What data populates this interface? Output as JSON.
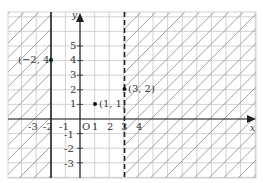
{
  "diagram": {
    "type": "coordinate-plane-inequality-graph",
    "axes": {
      "x_label": "x",
      "y_label": "y",
      "origin_label": "O",
      "x_ticks": [
        "-3",
        "-2",
        "-1",
        "1",
        "2",
        "3",
        "4"
      ],
      "y_ticks": [
        "5",
        "4",
        "3",
        "2",
        "1",
        "-1",
        "-2",
        "-3"
      ]
    },
    "boundaries": [
      {
        "equation": "x = -2",
        "style": "solid",
        "color": "#222222"
      },
      {
        "equation": "x = 3",
        "style": "dashed",
        "color": "#222222"
      }
    ],
    "shaded_regions": [
      {
        "description": "x <= -2",
        "pattern": "diagonal hatch"
      },
      {
        "description": "x > 3",
        "pattern": "diagonal hatch"
      }
    ],
    "points": [
      {
        "label": "(−2, 4)",
        "x": -2,
        "y": 4
      },
      {
        "label": "(1, 1)",
        "x": 1,
        "y": 1
      },
      {
        "label": "(3, 2)",
        "x": 3,
        "y": 2
      }
    ],
    "colors": {
      "grid": "#c8c8c8",
      "hatch": "#8a8a8a",
      "axis": "#222222"
    }
  }
}
